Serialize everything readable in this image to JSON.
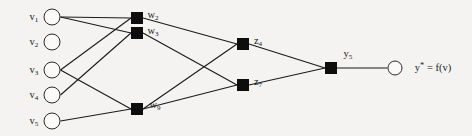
{
  "diagram": {
    "background_color": "#f4f3f1",
    "node_fill_circle": "#fbfaf8",
    "node_fill_square": "#0d0d0d",
    "edge_color": "#1a1a1a",
    "output_expression": "y* = f(v)"
  },
  "layers": {
    "input": {
      "name": "input-layer",
      "shape": "circle",
      "nodes": [
        {
          "id": "v1",
          "label": "v",
          "sub": "1",
          "x": 52,
          "y": 17,
          "r": 8.5
        },
        {
          "id": "v2",
          "label": "v",
          "sub": "2",
          "x": 52,
          "y": 42,
          "r": 8.5
        },
        {
          "id": "v3",
          "label": "v",
          "sub": "3",
          "x": 52,
          "y": 70,
          "r": 8.5
        },
        {
          "id": "v4",
          "label": "v",
          "sub": "4",
          "x": 52,
          "y": 95,
          "r": 8.5
        },
        {
          "id": "v5",
          "label": "v",
          "sub": "5",
          "x": 52,
          "y": 121,
          "r": 8.5
        }
      ]
    },
    "hidden1": {
      "name": "hidden-layer-1",
      "shape": "square",
      "nodes": [
        {
          "id": "w2",
          "label": "w",
          "sub": "2",
          "x": 137,
          "y": 18,
          "size": 12
        },
        {
          "id": "w3",
          "label": "w",
          "sub": "3",
          "x": 137,
          "y": 33,
          "size": 12
        },
        {
          "id": "w9",
          "label": "w",
          "sub": "9",
          "x": 137,
          "y": 109,
          "size": 12
        }
      ]
    },
    "hidden2": {
      "name": "hidden-layer-2",
      "shape": "square",
      "nodes": [
        {
          "id": "z4",
          "label": "z",
          "sub": "4",
          "x": 243,
          "y": 44,
          "size": 12
        },
        {
          "id": "z7",
          "label": "z",
          "sub": "7",
          "x": 243,
          "y": 85,
          "size": 12
        }
      ]
    },
    "output_node": {
      "name": "output-sum-node",
      "shape": "square",
      "nodes": [
        {
          "id": "y5",
          "label": "y",
          "sub": "5",
          "x": 331,
          "y": 68,
          "size": 12
        }
      ]
    },
    "output": {
      "name": "output-layer",
      "shape": "circle",
      "nodes": [
        {
          "id": "out",
          "label": "",
          "sub": "",
          "x": 395,
          "y": 68,
          "r": 7.5
        }
      ]
    }
  },
  "labels": {
    "v1": "v",
    "v2": "v",
    "v3": "v",
    "v4": "v",
    "v5": "v",
    "w2": "w",
    "w3": "w",
    "w9": "w",
    "z4": "z",
    "z7": "z",
    "y5": "y",
    "output_text": "y* = f(v)"
  },
  "edges": [
    {
      "from": "v1",
      "to": "w2"
    },
    {
      "from": "v1",
      "to": "w3"
    },
    {
      "from": "v3",
      "to": "w2"
    },
    {
      "from": "v3",
      "to": "w9"
    },
    {
      "from": "v4",
      "to": "w3"
    },
    {
      "from": "v5",
      "to": "w9"
    },
    {
      "from": "w2",
      "to": "z4"
    },
    {
      "from": "w3",
      "to": "z7"
    },
    {
      "from": "w9",
      "to": "z4"
    },
    {
      "from": "w9",
      "to": "z7"
    },
    {
      "from": "z4",
      "to": "y5"
    },
    {
      "from": "z7",
      "to": "y5"
    },
    {
      "from": "y5",
      "to": "out"
    }
  ]
}
